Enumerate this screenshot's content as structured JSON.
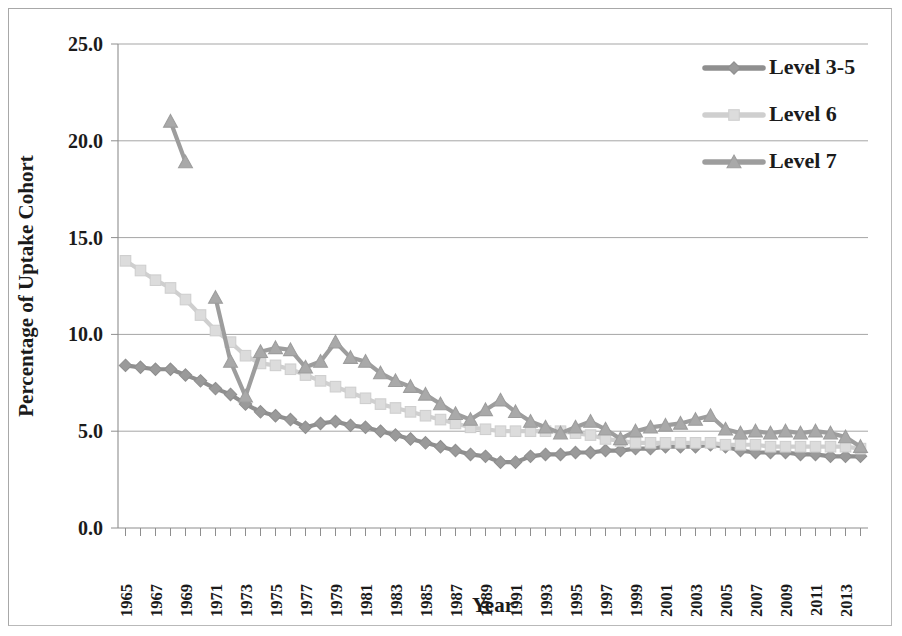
{
  "chart_data": {
    "type": "line",
    "title": "",
    "xlabel": "Year",
    "ylabel": "Percentage of Uptake Cohort",
    "ylim": [
      0,
      25
    ],
    "yticks": [
      0.0,
      5.0,
      10.0,
      15.0,
      20.0,
      25.0
    ],
    "ytick_labels": [
      "0.0",
      "5.0",
      "10.0",
      "15.0",
      "20.0",
      "25.0"
    ],
    "grid": true,
    "legend_position": "top-right",
    "x_label_rotation": -90,
    "xtick_labels": [
      "1965",
      "1967",
      "1969",
      "1971",
      "1973",
      "1975",
      "1977",
      "1979",
      "1981",
      "1983",
      "1985",
      "1987",
      "1989",
      "1991",
      "1993",
      "1995",
      "1997",
      "1999",
      "2001",
      "2003",
      "2005",
      "2007",
      "2009",
      "2011",
      "2013"
    ],
    "x": [
      1965,
      1966,
      1967,
      1968,
      1969,
      1970,
      1971,
      1972,
      1973,
      1974,
      1975,
      1976,
      1977,
      1978,
      1979,
      1980,
      1981,
      1982,
      1983,
      1984,
      1985,
      1986,
      1987,
      1988,
      1989,
      1990,
      1991,
      1992,
      1993,
      1994,
      1995,
      1996,
      1997,
      1998,
      1999,
      2000,
      2001,
      2002,
      2003,
      2004,
      2005,
      2006,
      2007,
      2008,
      2009,
      2010,
      2011,
      2012,
      2013,
      2014
    ],
    "series": [
      {
        "name": "Level 3-5",
        "marker": "diamond",
        "color": "#9a9a9a",
        "line_color": "#8f8f8f",
        "values": [
          8.4,
          8.3,
          8.2,
          8.2,
          7.9,
          7.6,
          7.2,
          6.9,
          6.4,
          6.0,
          5.8,
          5.6,
          5.2,
          5.4,
          5.5,
          5.3,
          5.2,
          5.0,
          4.8,
          4.6,
          4.4,
          4.2,
          4.0,
          3.8,
          3.7,
          3.4,
          3.4,
          3.7,
          3.8,
          3.8,
          3.9,
          3.9,
          4.0,
          4.0,
          4.1,
          4.1,
          4.2,
          4.2,
          4.2,
          4.3,
          4.2,
          4.0,
          3.9,
          3.9,
          3.9,
          3.8,
          3.8,
          3.7,
          3.7,
          3.7
        ]
      },
      {
        "name": "Level 6",
        "marker": "square",
        "color": "#dcdcdc",
        "line_color": "#cfcfcf",
        "values": [
          13.8,
          13.3,
          12.8,
          12.4,
          11.8,
          11.0,
          10.2,
          9.6,
          8.9,
          8.5,
          8.4,
          8.2,
          7.9,
          7.6,
          7.3,
          7.0,
          6.7,
          6.4,
          6.2,
          6.0,
          5.8,
          5.6,
          5.4,
          5.2,
          5.1,
          5.0,
          5.0,
          5.0,
          5.0,
          5.0,
          4.9,
          4.8,
          4.6,
          4.5,
          4.4,
          4.4,
          4.4,
          4.4,
          4.4,
          4.4,
          4.3,
          4.3,
          4.3,
          4.2,
          4.2,
          4.2,
          4.2,
          4.2,
          4.2,
          4.1
        ]
      },
      {
        "name": "Level 7",
        "marker": "triangle",
        "color": "#a9a9a9",
        "line_color": "#9d9d9d",
        "values": [
          null,
          null,
          null,
          21.0,
          18.9,
          null,
          11.9,
          8.6,
          6.8,
          9.1,
          9.3,
          9.2,
          8.3,
          8.6,
          9.6,
          8.8,
          8.6,
          8.0,
          7.6,
          7.3,
          6.9,
          6.4,
          5.9,
          5.6,
          6.1,
          6.6,
          6.0,
          5.5,
          5.2,
          4.9,
          5.2,
          5.5,
          5.1,
          4.6,
          5.0,
          5.2,
          5.3,
          5.4,
          5.6,
          5.8,
          5.1,
          4.9,
          5.0,
          4.9,
          5.0,
          4.9,
          5.0,
          4.9,
          4.7,
          4.2
        ]
      }
    ]
  },
  "legend": {
    "items": [
      {
        "label": "Level 3-5"
      },
      {
        "label": "Level 6"
      },
      {
        "label": "Level 7"
      }
    ]
  }
}
